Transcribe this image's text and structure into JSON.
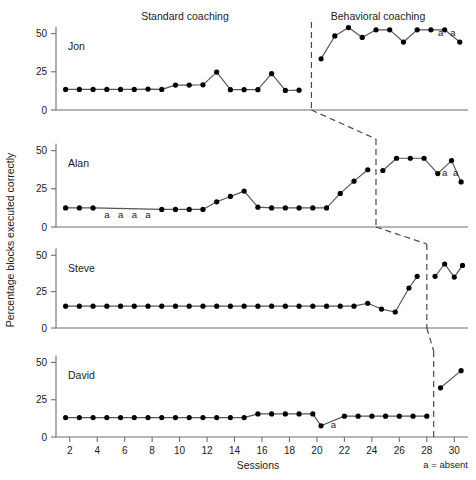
{
  "header": {
    "phase_left": "Standard coaching",
    "phase_right": "Behavioral coaching"
  },
  "axes": {
    "ylabel": "Percentage blocks executed correctly",
    "xlabel": "Sessions",
    "yticks": [
      "0",
      "25",
      "50"
    ],
    "xticks": [
      "2",
      "4",
      "6",
      "8",
      "10",
      "12",
      "14",
      "16",
      "18",
      "20",
      "22",
      "24",
      "26",
      "28",
      "30"
    ]
  },
  "legend": {
    "absent_note": "a = absent",
    "absent_symbol": "a"
  },
  "panels": {
    "jon": {
      "label": "Jon"
    },
    "alan": {
      "label": "Alan"
    },
    "steve": {
      "label": "Steve"
    },
    "david": {
      "label": "David"
    }
  },
  "colors": {
    "line": "#555555",
    "marker": "#000000",
    "axis": "#6e6e6e",
    "phase_line": "#4a4a4a",
    "text": "#1a1a1a",
    "background": "#ffffff"
  },
  "chart_data": {
    "type": "line",
    "title": "",
    "subtitle": "",
    "xlabel": "Sessions",
    "ylabel": "Percentage blocks executed correctly",
    "xlim": [
      1,
      31
    ],
    "ylim": [
      0,
      55
    ],
    "yticks": [
      0,
      25,
      50
    ],
    "xticks": [
      2,
      4,
      6,
      8,
      10,
      12,
      14,
      16,
      18,
      20,
      22,
      24,
      26,
      28,
      30
    ],
    "grid": false,
    "legend_position": "none",
    "design": "multiple-baseline across participants",
    "phases": [
      "Standard coaching",
      "Behavioral coaching"
    ],
    "annotations": [
      {
        "text": "a = absent",
        "where": "below-axis-right"
      }
    ],
    "series": [
      {
        "name": "Jon",
        "phase_change_x": 19.6,
        "x": [
          1.7,
          2.7,
          3.7,
          4.7,
          5.7,
          6.7,
          7.7,
          8.7,
          9.7,
          10.7,
          11.7,
          12.7,
          13.7,
          14.7,
          15.7,
          16.7,
          17.7,
          18.7,
          20.3,
          21.3,
          22.3,
          23.3,
          24.3,
          25.3,
          26.3,
          27.3,
          28.3,
          29.3,
          30.4
        ],
        "values": [
          13.5,
          13.5,
          13.5,
          13.5,
          13.5,
          13.5,
          13.7,
          13.5,
          16.3,
          16.3,
          16.5,
          24.8,
          13.3,
          13.3,
          13.3,
          23.8,
          12.8,
          13.0,
          33.5,
          48.5,
          54.0,
          47.5,
          52.5,
          52.5,
          44.5,
          52.5,
          52.5,
          52.5,
          44.5
        ],
        "absent": [
          {
            "x": 29.0,
            "label": "a"
          },
          {
            "x": 29.9,
            "label": "a"
          }
        ]
      },
      {
        "name": "Alan",
        "phase_change_x": 24.3,
        "x": [
          1.7,
          2.7,
          3.7,
          8.7,
          9.7,
          10.7,
          11.7,
          12.7,
          13.7,
          14.7,
          15.7,
          16.7,
          17.7,
          18.7,
          19.7,
          20.7,
          21.7,
          22.7,
          23.7,
          24.8,
          25.8,
          26.8,
          27.8,
          28.8,
          29.8,
          30.5
        ],
        "values": [
          12.5,
          12.5,
          12.5,
          11.5,
          11.5,
          11.5,
          11.5,
          16.5,
          20.0,
          23.5,
          13.0,
          12.5,
          12.5,
          12.5,
          12.5,
          12.5,
          22.0,
          30.0,
          37.5,
          37.0,
          45.0,
          45.0,
          45.0,
          35.0,
          43.5,
          29.5
        ],
        "absent": [
          {
            "x": 4.7,
            "label": "a"
          },
          {
            "x": 5.7,
            "label": "a"
          },
          {
            "x": 6.7,
            "label": "a"
          },
          {
            "x": 7.7,
            "label": "a"
          },
          {
            "x": 29.3,
            "label": "a"
          },
          {
            "x": 30.1,
            "label": "a"
          }
        ]
      },
      {
        "name": "Steve",
        "phase_change_x": 28.0,
        "x": [
          1.7,
          2.7,
          3.7,
          4.7,
          5.7,
          6.7,
          7.7,
          8.7,
          9.7,
          10.7,
          11.7,
          12.7,
          13.7,
          14.7,
          15.7,
          16.7,
          17.7,
          18.7,
          19.7,
          20.7,
          21.7,
          22.7,
          23.7,
          24.7,
          25.7,
          26.7,
          27.3,
          28.6,
          29.3,
          30.0,
          30.6
        ],
        "values": [
          15.0,
          15.0,
          15.0,
          15.0,
          15.0,
          15.0,
          15.0,
          15.0,
          15.0,
          15.0,
          15.0,
          15.0,
          15.0,
          15.0,
          15.0,
          15.0,
          15.0,
          15.0,
          15.0,
          15.0,
          15.0,
          15.0,
          17.0,
          13.0,
          11.0,
          27.5,
          35.5,
          35.5,
          44.0,
          35.0,
          43.0
        ],
        "absent": []
      },
      {
        "name": "David",
        "phase_change_x": 28.5,
        "x": [
          1.7,
          2.7,
          3.7,
          4.7,
          5.7,
          6.7,
          7.7,
          8.7,
          9.7,
          10.7,
          11.7,
          12.7,
          13.7,
          14.7,
          15.7,
          16.7,
          17.7,
          18.7,
          19.7,
          20.3,
          22.0,
          23.0,
          24.0,
          25.0,
          26.0,
          27.0,
          28.0,
          29.0,
          30.5
        ],
        "values": [
          13.0,
          13.0,
          13.0,
          13.0,
          13.0,
          13.0,
          13.0,
          13.0,
          13.0,
          13.0,
          13.0,
          13.0,
          13.0,
          13.0,
          15.5,
          15.5,
          15.5,
          15.5,
          15.5,
          7.5,
          14.0,
          14.0,
          14.0,
          14.0,
          14.0,
          14.0,
          14.0,
          33.0,
          44.5
        ],
        "absent": [
          {
            "x": 21.2,
            "label": "a"
          }
        ]
      }
    ]
  }
}
